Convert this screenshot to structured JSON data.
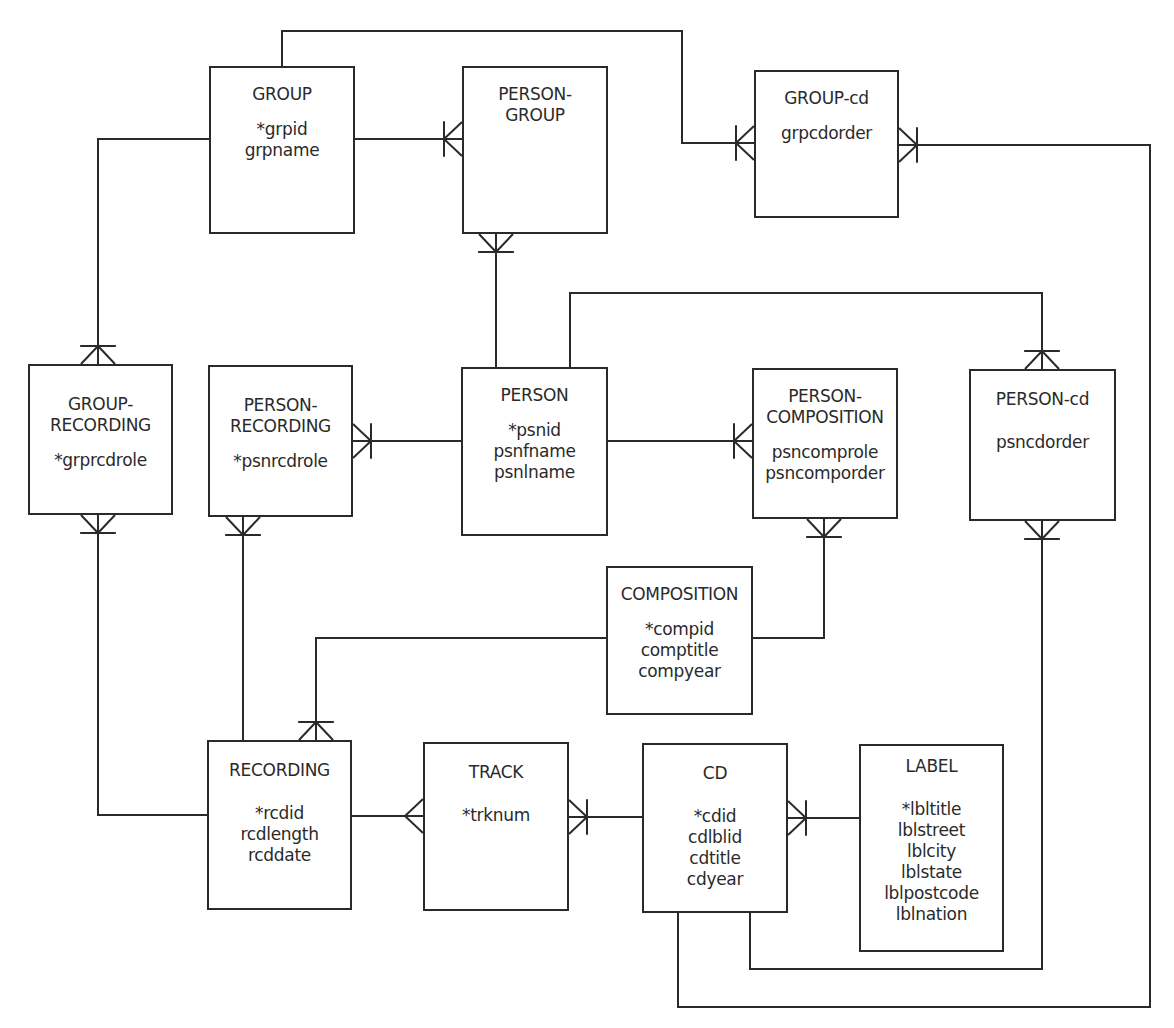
{
  "diagram": {
    "type": "entity-relationship",
    "line_color": "#2a2a2a",
    "entities": [
      {
        "id": "group",
        "title": [
          "GROUP"
        ],
        "attributes": [
          "*grpid",
          "grpname"
        ],
        "box": [
          209,
          66,
          146,
          168
        ]
      },
      {
        "id": "person-group",
        "title": [
          "PERSON-",
          "GROUP"
        ],
        "attributes": [],
        "box": [
          462,
          66,
          146,
          168
        ]
      },
      {
        "id": "group-cd",
        "title": [
          "GROUP-cd"
        ],
        "attributes": [
          "grpcdorder"
        ],
        "box": [
          754,
          70,
          145,
          148
        ]
      },
      {
        "id": "group-recording",
        "title": [
          "GROUP-",
          "RECORDING"
        ],
        "attributes": [
          "*grprcdrole"
        ],
        "box": [
          28,
          364,
          145,
          151
        ]
      },
      {
        "id": "person-recording",
        "title": [
          "PERSON-",
          "RECORDING"
        ],
        "attributes": [
          "*psnrcdrole"
        ],
        "box": [
          208,
          365,
          145,
          152
        ]
      },
      {
        "id": "person",
        "title": [
          "PERSON"
        ],
        "attributes": [
          "*psnid",
          "psnfname",
          "psnlname"
        ],
        "box": [
          461,
          367,
          147,
          169
        ]
      },
      {
        "id": "person-composition",
        "title": [
          "PERSON-",
          "COMPOSITION"
        ],
        "attributes": [
          "psncomprole",
          "psncomporder"
        ],
        "box": [
          752,
          368,
          146,
          151
        ]
      },
      {
        "id": "person-cd",
        "title": [
          "PERSON-cd"
        ],
        "attributes": [
          "psncdorder"
        ],
        "box": [
          969,
          369,
          147,
          152
        ]
      },
      {
        "id": "composition",
        "title": [
          "COMPOSITION"
        ],
        "attributes": [
          "*compid",
          "comptitle",
          "compyear"
        ],
        "box": [
          606,
          566,
          147,
          149
        ]
      },
      {
        "id": "recording",
        "title": [
          "RECORDING"
        ],
        "attributes": [
          "*rcdid",
          "rcdlength",
          "rcddate"
        ],
        "box": [
          207,
          740,
          145,
          170
        ]
      },
      {
        "id": "track",
        "title": [
          "TRACK"
        ],
        "attributes": [
          "*trknum"
        ],
        "box": [
          423,
          742,
          146,
          169
        ]
      },
      {
        "id": "cd",
        "title": [
          "CD"
        ],
        "attributes": [
          "*cdid",
          "cdlblid",
          "cdtitle",
          "cdyear"
        ],
        "box": [
          642,
          743,
          146,
          170
        ]
      },
      {
        "id": "label",
        "title": [
          "LABEL"
        ],
        "attributes": [
          "*lbltitle",
          "lblstreet",
          "lblcity",
          "lblstate",
          "lblpostcode",
          "lblnation"
        ],
        "box": [
          859,
          744,
          145,
          208
        ]
      }
    ],
    "relationships": [
      {
        "from": "group",
        "to": "person-group",
        "path": [
          [
            355,
            139
          ],
          [
            462,
            139
          ]
        ],
        "end": "many-one",
        "end_dir": "right"
      },
      {
        "from": "group",
        "to": "group-cd",
        "path": [
          [
            282,
            66
          ],
          [
            282,
            31
          ],
          [
            682,
            31
          ],
          [
            682,
            143
          ],
          [
            754,
            143
          ]
        ],
        "end": "many-one",
        "end_dir": "right"
      },
      {
        "from": "group",
        "to": "group-recording",
        "path": [
          [
            209,
            139
          ],
          [
            98,
            139
          ],
          [
            98,
            364
          ]
        ],
        "end": "many-one",
        "end_dir": "down"
      },
      {
        "from": "person",
        "to": "person-group",
        "path": [
          [
            496,
            367
          ],
          [
            496,
            234
          ]
        ],
        "end": "many-one",
        "end_dir": "up"
      },
      {
        "from": "person",
        "to": "person-recording",
        "path": [
          [
            461,
            441
          ],
          [
            353,
            441
          ]
        ],
        "end": "many-one",
        "end_dir": "left"
      },
      {
        "from": "person",
        "to": "person-composition",
        "path": [
          [
            608,
            441
          ],
          [
            752,
            441
          ]
        ],
        "end": "many-one",
        "end_dir": "right"
      },
      {
        "from": "person",
        "to": "person-cd",
        "path": [
          [
            570,
            367
          ],
          [
            570,
            293
          ],
          [
            1042,
            293
          ],
          [
            1042,
            369
          ]
        ],
        "end": "many-one",
        "end_dir": "down"
      },
      {
        "from": "recording",
        "to": "group-recording",
        "path": [
          [
            207,
            815
          ],
          [
            98,
            815
          ],
          [
            98,
            515
          ]
        ],
        "end": "many-one",
        "end_dir": "up"
      },
      {
        "from": "recording",
        "to": "person-recording",
        "path": [
          [
            243,
            740
          ],
          [
            243,
            517
          ]
        ],
        "end": "many-one",
        "end_dir": "up"
      },
      {
        "from": "composition",
        "to": "recording",
        "path": [
          [
            606,
            638
          ],
          [
            316,
            638
          ],
          [
            316,
            740
          ]
        ],
        "end": "many-one",
        "end_dir": "down"
      },
      {
        "from": "composition",
        "to": "person-composition",
        "path": [
          [
            753,
            638
          ],
          [
            824,
            638
          ],
          [
            824,
            519
          ]
        ],
        "end": "many-one",
        "end_dir": "up"
      },
      {
        "from": "recording",
        "to": "track",
        "path": [
          [
            352,
            816
          ],
          [
            423,
            816
          ]
        ],
        "end": "many",
        "end_dir": "right"
      },
      {
        "from": "cd",
        "to": "track",
        "path": [
          [
            642,
            817
          ],
          [
            569,
            817
          ]
        ],
        "end": "many-one",
        "end_dir": "left"
      },
      {
        "from": "label",
        "to": "cd",
        "path": [
          [
            859,
            818
          ],
          [
            788,
            818
          ]
        ],
        "end": "many-one",
        "end_dir": "left"
      },
      {
        "from": "cd",
        "to": "person-cd",
        "path": [
          [
            750,
            913
          ],
          [
            750,
            969
          ],
          [
            1042,
            969
          ],
          [
            1042,
            521
          ]
        ],
        "end": "many-one",
        "end_dir": "up"
      },
      {
        "from": "cd",
        "to": "group-cd",
        "path": [
          [
            678,
            913
          ],
          [
            678,
            1007
          ],
          [
            1150,
            1007
          ],
          [
            1150,
            145
          ],
          [
            899,
            145
          ]
        ],
        "end": "many-one",
        "end_dir": "left"
      }
    ]
  }
}
